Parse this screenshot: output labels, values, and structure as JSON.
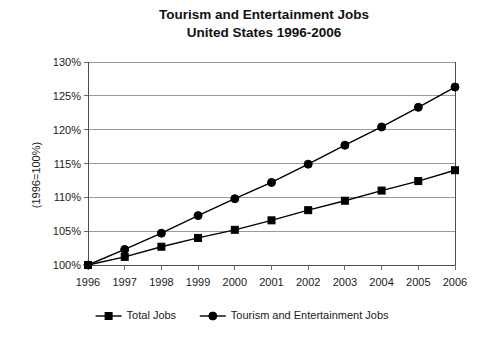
{
  "chart_data": {
    "type": "line",
    "title": "Tourism and Entertainment Jobs",
    "subtitle": "United States 1996-2006",
    "xlabel": "",
    "ylabel": "(1996=100%)",
    "categories": [
      "1996",
      "1997",
      "1998",
      "1999",
      "2000",
      "2001",
      "2002",
      "2003",
      "2004",
      "2005",
      "2006"
    ],
    "x": [
      1996,
      1997,
      1998,
      1999,
      2000,
      2001,
      2002,
      2003,
      2004,
      2005,
      2006
    ],
    "ylim": [
      100,
      130
    ],
    "ytick_values": [
      100,
      105,
      110,
      115,
      120,
      125,
      130
    ],
    "ytick_labels": [
      "100%",
      "105%",
      "110%",
      "115%",
      "120%",
      "125%",
      "130%"
    ],
    "grid": true,
    "legend_position": "bottom",
    "series": [
      {
        "name": "Total Jobs",
        "marker": "square",
        "color": "#000000",
        "values": [
          100.0,
          101.2,
          102.7,
          104.0,
          105.2,
          106.6,
          108.1,
          109.5,
          111.0,
          112.4,
          114.0
        ]
      },
      {
        "name": "Tourism and Entertainment Jobs",
        "marker": "circle",
        "color": "#000000",
        "values": [
          100.0,
          102.3,
          104.7,
          107.3,
          109.8,
          112.2,
          114.9,
          117.7,
          120.4,
          123.3,
          126.3
        ]
      }
    ]
  }
}
